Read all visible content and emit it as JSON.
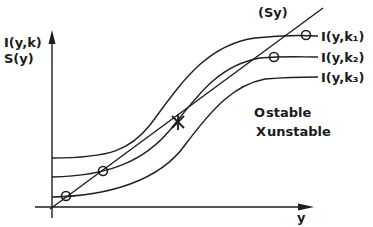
{
  "diagram": {
    "y_axis_label_line1": "I(y,k)",
    "y_axis_label_line2": "S(y)",
    "x_axis_label": "y",
    "savings_line_label": "(Sy)",
    "curves": [
      {
        "label": "I(y,k₁)",
        "name": "I(y,k1)"
      },
      {
        "label": "I(y,k₂)",
        "name": "I(y,k2)"
      },
      {
        "label": "I(y,k₃)",
        "name": "I(y,k3)"
      }
    ],
    "legend": {
      "stable_symbol": "O",
      "stable_label": "stable",
      "unstable_symbol": "X",
      "unstable_label": "unstable"
    },
    "colors": {
      "ink": "#1e1e1e",
      "background": "#ffffff"
    }
  }
}
